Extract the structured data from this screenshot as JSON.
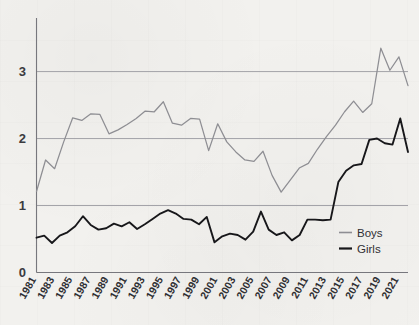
{
  "chart_data": {
    "type": "line",
    "title": "",
    "subtitle": "",
    "xlabel": "",
    "ylabel": "",
    "xlim": [
      1981,
      2022
    ],
    "ylim": [
      0,
      3.8
    ],
    "grid": "horizontal",
    "legend_position": "bottom-right",
    "y_ticks": [
      "0",
      "1",
      "2",
      "3"
    ],
    "y_tick_values": [
      0,
      1,
      2,
      3
    ],
    "x_ticks": [
      "1981",
      "1983",
      "1985",
      "1987",
      "1989",
      "1991",
      "1993",
      "1995",
      "1997",
      "1999",
      "2001",
      "2003",
      "2005",
      "2007",
      "2009",
      "2011",
      "2013",
      "2015",
      "2017",
      "2019",
      "2021"
    ],
    "x": [
      1981,
      1982,
      1983,
      1984,
      1985,
      1986,
      1987,
      1988,
      1989,
      1990,
      1991,
      1992,
      1993,
      1994,
      1995,
      1996,
      1997,
      1998,
      1999,
      2000,
      2001,
      2002,
      2003,
      2004,
      2005,
      2006,
      2007,
      2008,
      2009,
      2010,
      2011,
      2012,
      2013,
      2014,
      2015,
      2016,
      2017,
      2018,
      2019,
      2020,
      2021,
      2022
    ],
    "series": [
      {
        "name": "Boys",
        "color": "#8e8e93",
        "values": [
          1.21,
          1.68,
          1.55,
          1.95,
          2.31,
          2.27,
          2.37,
          2.36,
          2.07,
          2.13,
          2.21,
          2.3,
          2.41,
          2.4,
          2.55,
          2.23,
          2.2,
          2.3,
          2.29,
          1.82,
          2.22,
          1.95,
          1.8,
          1.68,
          1.66,
          1.81,
          1.45,
          1.2,
          1.38,
          1.56,
          1.63,
          1.84,
          2.03,
          2.2,
          2.4,
          2.56,
          2.39,
          2.52,
          3.35,
          3.02,
          3.22,
          2.79
        ],
        "points_note": "gray line, starts low-left, big rise after 2016, peak 2019"
      },
      {
        "name": "Girls",
        "color": "#17171a",
        "values": [
          0.52,
          0.55,
          0.44,
          0.55,
          0.6,
          0.69,
          0.84,
          0.71,
          0.64,
          0.66,
          0.73,
          0.69,
          0.75,
          0.65,
          0.72,
          0.8,
          0.88,
          0.93,
          0.88,
          0.8,
          0.79,
          0.72,
          0.83,
          0.45,
          0.54,
          0.58,
          0.56,
          0.49,
          0.61,
          0.91,
          0.64,
          0.56,
          0.6,
          0.48,
          0.56,
          0.79,
          0.79,
          0.78,
          0.79,
          0.77,
          1.35,
          1.4
        ],
        "values_corrected": [
          0.52,
          0.55,
          0.44,
          0.55,
          0.6,
          0.69,
          0.84,
          0.71,
          0.64,
          0.66,
          0.73,
          0.69,
          0.75,
          0.65,
          0.72,
          0.8,
          0.88,
          0.93,
          0.88,
          0.8,
          0.79,
          0.72,
          0.83,
          0.45,
          0.54,
          0.58,
          0.56,
          0.49,
          0.61,
          0.91,
          0.64,
          0.56,
          0.6,
          0.48,
          0.56,
          0.79,
          0.79,
          0.78,
          0.79,
          0.77,
          1.35,
          1.4
        ],
        "points_note": "black line, flat near 0.5-0.9, sharp jump 2012-2013, rises to 2.3 peak 2021"
      }
    ],
    "series_girls_full": [
      0.52,
      0.55,
      0.44,
      0.55,
      0.6,
      0.69,
      0.84,
      0.71,
      0.64,
      0.66,
      0.73,
      0.69,
      0.75,
      0.65,
      0.72,
      0.8,
      0.88,
      0.93,
      0.88,
      0.8,
      0.79,
      0.72,
      0.83,
      0.45,
      0.54,
      0.58,
      0.56,
      0.49,
      0.61,
      0.91,
      0.64,
      0.56,
      0.6,
      0.48,
      0.56,
      0.79,
      0.79,
      0.78,
      0.79,
      1.35,
      1.52,
      1.6,
      1.62,
      1.98,
      2.0,
      1.93,
      1.91,
      2.3,
      1.8
    ]
  },
  "legend": {
    "items": [
      {
        "label": "Boys",
        "color": "#8e8e93"
      },
      {
        "label": "Girls",
        "color": "#17171a"
      }
    ]
  }
}
